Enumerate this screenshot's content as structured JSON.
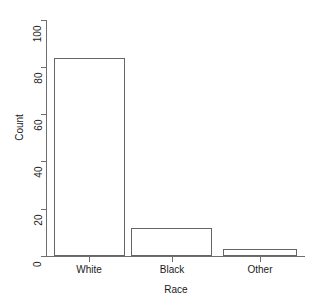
{
  "chart_data": {
    "type": "bar",
    "title": "",
    "subtitle": "",
    "categories": [
      "White",
      "Black",
      "Other"
    ],
    "values": [
      84,
      12,
      3
    ],
    "series": [
      {
        "name": "Count",
        "values": [
          84,
          12,
          3
        ]
      }
    ],
    "xlabel": "Race",
    "ylabel": "Count",
    "ylim": [
      0,
      100
    ],
    "yticks": [
      0,
      20,
      40,
      60,
      80,
      100
    ],
    "ytick_labels": [
      "0",
      "20",
      "40",
      "60",
      "80",
      "100"
    ],
    "grid": false,
    "legend": false,
    "legend_position": "none",
    "bar_fill_color": "#ffffff",
    "bar_border_color": "#666666",
    "axis_color": "#6e6e6e",
    "text_color": "#1a1a1a",
    "background_color": "#ffffff"
  },
  "axes": {
    "y_title": "Count",
    "x_title": "Race",
    "y_labels": {
      "t0": "0",
      "t20": "20",
      "t40": "40",
      "t60": "60",
      "t80": "80",
      "t100": "100"
    },
    "x_labels": {
      "c0": "White",
      "c1": "Black",
      "c2": "Other"
    }
  }
}
